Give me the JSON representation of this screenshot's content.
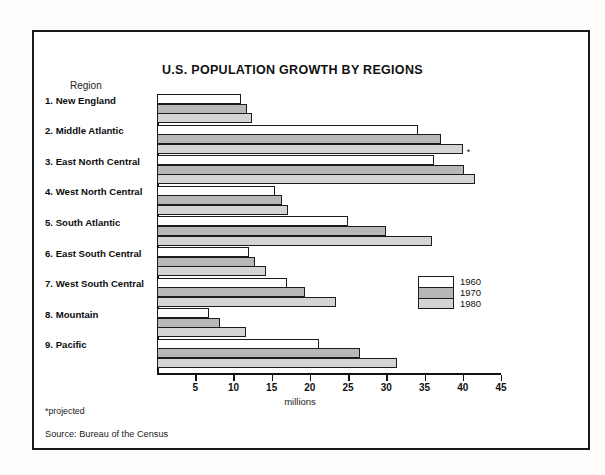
{
  "chart_data": {
    "type": "bar",
    "orientation": "horizontal",
    "title": "U.S. POPULATION GROWTH BY REGIONS",
    "xlabel": "millions",
    "ylabel": "Region",
    "category_header": "Region",
    "xlim": [
      0,
      45
    ],
    "xticks": [
      5,
      10,
      15,
      20,
      25,
      30,
      35,
      40,
      45
    ],
    "grid": false,
    "legend_position": "inside-right",
    "categories": [
      "1. New England",
      "2. Middle Atlantic",
      "3. East North Central",
      "4. West North Central",
      "5. South Atlantic",
      "6. East South Central",
      "7. West South Central",
      "8. Mountain",
      "9. Pacific"
    ],
    "series": [
      {
        "name": "1960",
        "color": "#ffffff",
        "values": [
          11.0,
          34.2,
          36.2,
          15.4,
          25.0,
          12.0,
          17.0,
          6.8,
          21.2
        ]
      },
      {
        "name": "1970",
        "color": "#b7b7b7",
        "values": [
          11.8,
          37.2,
          40.2,
          16.4,
          30.0,
          12.8,
          19.4,
          8.2,
          26.6
        ]
      },
      {
        "name": "1980",
        "color": "#d4d4d4",
        "values": [
          12.4,
          40.0,
          41.6,
          17.2,
          36.0,
          14.2,
          23.4,
          11.6,
          31.4
        ]
      }
    ],
    "annotations": [
      {
        "text": "*",
        "category": "2. Middle Atlantic",
        "series": "1980",
        "note": "projected"
      }
    ],
    "footnotes": [
      "*projected",
      "Source: Bureau of the Census"
    ]
  },
  "legend": {
    "entries": [
      {
        "label": "1960",
        "color": "#ffffff"
      },
      {
        "label": "1970",
        "color": "#b7b7b7"
      },
      {
        "label": "1980",
        "color": "#d4d4d4"
      }
    ]
  },
  "footnotes": {
    "projected": "*projected",
    "source": "Source: Bureau of the Census"
  },
  "axis": {
    "tick_labels": [
      "5",
      "10",
      "15",
      "20",
      "25",
      "30",
      "35",
      "40",
      "45"
    ],
    "units_label": "millions"
  },
  "colors": {
    "frame": "#1a1a1a",
    "bar_1960": "#ffffff",
    "bar_1970": "#b7b7b7",
    "bar_1980": "#d4d4d4",
    "text": "#111111"
  }
}
